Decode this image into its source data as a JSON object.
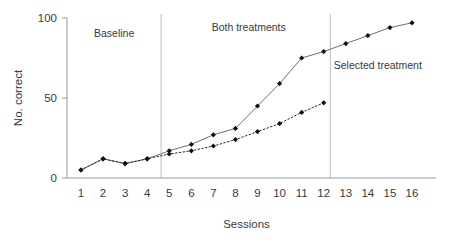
{
  "chart_data": {
    "type": "line",
    "title": "",
    "xlabel": "Sessions",
    "ylabel": "No. correct",
    "x": [
      1,
      2,
      3,
      4,
      5,
      6,
      7,
      8,
      9,
      10,
      11,
      12,
      13,
      14,
      15,
      16
    ],
    "xlim": [
      0.5,
      16.5
    ],
    "ylim": [
      0,
      100
    ],
    "grid": false,
    "legend_position": "none",
    "y_ticks": [
      0,
      50,
      100
    ],
    "y_tick_labels": [
      "0",
      "50",
      "100"
    ],
    "x_tick_labels": [
      "1",
      "2",
      "3",
      "4",
      "5",
      "6",
      "7",
      "8",
      "9",
      "10",
      "11",
      "12",
      "13",
      "14",
      "15",
      "16"
    ],
    "series": [
      {
        "name": "solid-series",
        "style": "solid",
        "marker": "filled-diamond",
        "x": [
          1,
          2,
          3,
          4,
          5,
          6,
          7,
          8,
          9,
          10,
          11,
          12,
          13,
          14,
          15,
          16
        ],
        "values": [
          5,
          12,
          9,
          12,
          17,
          21,
          27,
          31,
          45,
          59,
          75,
          79,
          84,
          89,
          94,
          97
        ]
      },
      {
        "name": "dotted-series",
        "style": "dotted",
        "marker": "filled-diamond",
        "x": [
          1,
          2,
          3,
          4,
          5,
          6,
          7,
          8,
          9,
          10,
          11,
          12
        ],
        "values": [
          5,
          12,
          9,
          12,
          15,
          17,
          20,
          24,
          29,
          34,
          41,
          47
        ]
      }
    ],
    "annotations": [
      {
        "name": "baseline",
        "text": "Baseline",
        "x": 2.5,
        "y": 88
      },
      {
        "name": "both-treatments",
        "text": "Both treatments",
        "x": 8.6,
        "y": 92
      },
      {
        "name": "selected-treatment",
        "text": "Selected treatment",
        "x": 14.45,
        "y": 68
      }
    ],
    "phase_dividers": [
      {
        "name": "baseline-to-both",
        "x": 4.63
      },
      {
        "name": "both-to-selected",
        "x": 12.3
      }
    ],
    "colors": {
      "solid_line": "#6f6f6f",
      "dotted_line": "#2a2a2a",
      "marker": "#111111",
      "axis": "#9a9a9a",
      "divider": "#bdbdbd",
      "text": "#3a3a3a",
      "background": "#ffffff"
    }
  }
}
